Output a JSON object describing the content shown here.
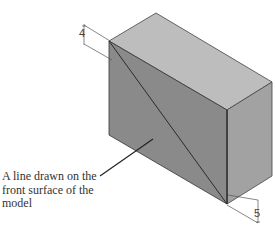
{
  "figure": {
    "callout_text": "A line drawn on the front surface of the model",
    "callout_lines": [
      "A line drawn on the",
      "front surface of the",
      "model"
    ],
    "section_label_top": "4",
    "section_label_bottom": "5"
  },
  "colors": {
    "front_face": "#8a8a8a",
    "top_face": "#bdbdbd",
    "right_face": "#a2a2a2",
    "edge": "#333333"
  }
}
